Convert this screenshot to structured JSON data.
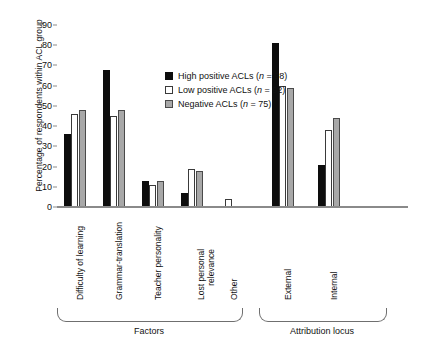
{
  "chart_data": {
    "type": "bar",
    "title": "",
    "xlabel": "",
    "ylabel": "Percentage of respondents within ACL group",
    "ylim": [
      0,
      90
    ],
    "yticks": [
      0,
      10,
      20,
      30,
      40,
      50,
      60,
      70,
      80,
      90
    ],
    "grid": false,
    "legend_position": "top-left-inside",
    "categories": [
      "Difficulty of learning",
      "Grammar-translation",
      "Teacher personality",
      "Lost personal relevance",
      "Other",
      "External",
      "Internal"
    ],
    "series": [
      {
        "name": "High positive ACLs (n = 98)",
        "color": "#0d0d0d",
        "style": "black",
        "values": [
          36,
          68,
          13,
          7,
          0,
          81,
          21
        ]
      },
      {
        "name": "Low positive ACLs (n = 92)",
        "color": "#ffffff",
        "style": "white",
        "values": [
          46,
          45,
          11,
          19,
          4,
          60,
          38
        ]
      },
      {
        "name": "Negative ACLs (n = 75)",
        "color": "#a8a8a8",
        "style": "gray",
        "values": [
          48,
          48,
          13,
          18,
          0,
          59,
          44
        ]
      }
    ],
    "groups": [
      {
        "label": "Factors",
        "categories": [
          "Difficulty of learning",
          "Grammar-translation",
          "Teacher personality",
          "Lost personal relevance",
          "Other"
        ]
      },
      {
        "label": "Attribution locus",
        "categories": [
          "External",
          "Internal"
        ]
      }
    ],
    "legend": [
      {
        "marker": "black-square",
        "label": "High positive ACLs (",
        "italic": "n",
        "label_end": " = 98)"
      },
      {
        "marker": "white-square",
        "label": "Low positive ACLs (",
        "italic": "n",
        "label_end": " = 92)"
      },
      {
        "marker": "gray-square",
        "label": "Negative ACLs (",
        "italic": "n",
        "label_end": " = 75)"
      }
    ]
  },
  "axis": {
    "y_title": "Percentage of respondents within ACL group",
    "y_tick_labels": [
      "90",
      "80",
      "70",
      "60",
      "50",
      "40",
      "30",
      "20",
      "10",
      "0"
    ]
  },
  "category_labels": {
    "c0": "Difficulty of learning",
    "c1": "Grammar-translation",
    "c2": "Teacher personality",
    "c3_line1": "Lost personal",
    "c3_line2": "relevance",
    "c4": "Other",
    "c5": "External",
    "c6": "Internal"
  },
  "group_labels": {
    "g0": "Factors",
    "g1": "Attribution locus"
  }
}
